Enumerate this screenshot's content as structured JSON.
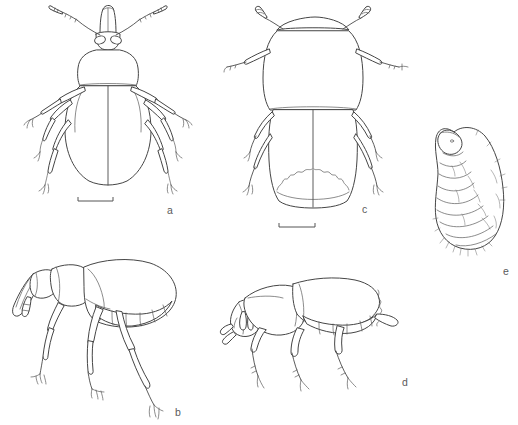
{
  "plate": {
    "title": "Beetle and weevil morphology plate",
    "background_color": "#ffffff",
    "line_color": "#4a4a4a",
    "label_color": "#5b5b5b",
    "width": 518,
    "height": 425,
    "figure_count": 5
  },
  "panels": [
    {
      "id": "a",
      "label": "a",
      "label_x": 167,
      "label_y": 205,
      "caption": "Adult weevil, dorsal view",
      "view": "dorsal",
      "subject": "adult weevil",
      "features": [
        "rostrum",
        "geniculate antennae",
        "compound eyes",
        "pronotum",
        "elytra with sutural line",
        "three pairs of legs with tarsi"
      ]
    },
    {
      "id": "b",
      "label": "b",
      "label_x": 175,
      "label_y": 407,
      "caption": "Adult weevil, lateral view",
      "view": "lateral",
      "subject": "adult weevil",
      "features": [
        "elongate rostrum",
        "antennal club",
        "pronotum",
        "elytra",
        "abdominal sternites",
        "femur",
        "tibia",
        "tarsal claws"
      ]
    },
    {
      "id": "c",
      "label": "c",
      "label_x": 362,
      "label_y": 204,
      "caption": "Adult beetle, dorsal view",
      "view": "dorsal",
      "subject": "adult beetle",
      "features": [
        "clubbed antennae",
        "broad pronotum",
        "parallel-sided elytra",
        "serrate elytral apex",
        "three pairs of legs"
      ]
    },
    {
      "id": "d",
      "label": "d",
      "label_x": 402,
      "label_y": 377,
      "caption": "Adult beetle, lateral view",
      "view": "lateral",
      "subject": "adult beetle",
      "features": [
        "short head",
        "clubbed antenna",
        "pronotum",
        "declivous elytral apex",
        "exposed pygidium",
        "stout legs"
      ]
    },
    {
      "id": "e",
      "label": "e",
      "label_x": 503,
      "label_y": 266,
      "caption": "Larva, lateral view",
      "view": "lateral",
      "subject": "scarabaeiform larva (grub)",
      "features": [
        "C-shaped body",
        "sclerotized head capsule",
        "segmented abdomen",
        "setae",
        "spiracles"
      ]
    }
  ],
  "scale_bars": [
    {
      "for_panel": "a",
      "x1": 78,
      "x2": 113,
      "y": 201,
      "tick_height": 5
    },
    {
      "for_panel": "c",
      "x1": 279,
      "x2": 315,
      "y": 227,
      "tick_height": 5
    }
  ]
}
